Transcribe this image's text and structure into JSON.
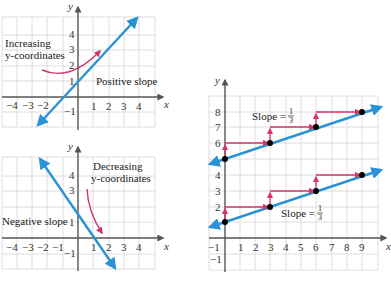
{
  "colors": {
    "line": "#2a93d5",
    "arrow": "#d6336c",
    "grid": "#d6d6d6",
    "axis": "#555555",
    "point": "#000000"
  },
  "graph_positive": {
    "x_axis_label": "x",
    "y_axis_label": "y",
    "x_ticks": [
      "−4",
      "−3",
      "−2",
      "1",
      "2",
      "3",
      "4"
    ],
    "y_ticks": [
      "4",
      "3",
      "2",
      "1",
      "−1"
    ],
    "annotation_line1": "Increasing",
    "annotation_line2": "y-coordinates",
    "slope_label": "Positive slope"
  },
  "graph_negative": {
    "x_axis_label": "x",
    "y_axis_label": "y",
    "x_ticks": [
      "−4",
      "−3",
      "−2",
      "−1",
      "1",
      "2",
      "3",
      "4"
    ],
    "y_ticks": [
      "4",
      "3",
      "1",
      "−1"
    ],
    "annotation_line1": "Decreasing",
    "annotation_line2": "y-coordinates",
    "slope_label": "Negative slope"
  },
  "graph_parallel": {
    "x_axis_label": "x",
    "y_axis_label": "y",
    "x_ticks": [
      "−1",
      "1",
      "2",
      "3",
      "4",
      "5",
      "6",
      "7",
      "8",
      "9"
    ],
    "y_ticks": [
      "8",
      "7",
      "6",
      "4",
      "3",
      "2",
      "−1"
    ],
    "upper_slope_label": "Slope =",
    "upper_slope_num": "1",
    "upper_slope_den": "3",
    "lower_slope_label": "Slope =",
    "lower_slope_num": "1",
    "lower_slope_den": "3",
    "upper_points": [
      [
        0,
        5
      ],
      [
        3,
        6
      ],
      [
        6,
        7
      ],
      [
        9,
        8
      ]
    ],
    "lower_points": [
      [
        0,
        1
      ],
      [
        3,
        2
      ],
      [
        6,
        3
      ],
      [
        9,
        4
      ]
    ]
  }
}
